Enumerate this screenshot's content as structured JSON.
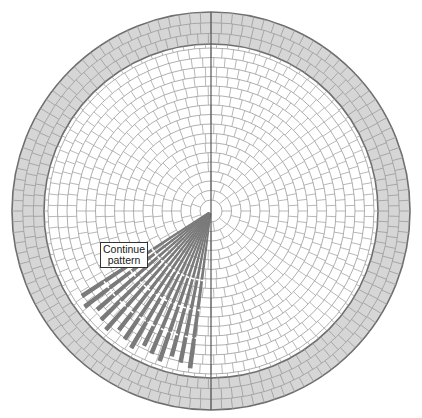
{
  "diagram": {
    "center": [
      211,
      211
    ],
    "outer_radius": 199,
    "border_inner_radius": 167,
    "border_rows": 3,
    "center_circle_radius": 11,
    "field_ring_spacing": 9.5,
    "colors": {
      "background": "#ffffff",
      "border_fill": "#d6d6d6",
      "grid_line": "#9a9a9a",
      "outline": "#6e6e6e",
      "axis_line": "#555555",
      "wedge": "#7a7a7a"
    },
    "wedges": {
      "start_angle_deg": 97,
      "end_angle_deg": 146,
      "count": 14,
      "max_radius": 158
    }
  },
  "label": {
    "line1": "Continue",
    "line2": "pattern"
  }
}
